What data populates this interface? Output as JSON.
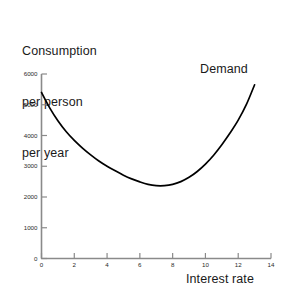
{
  "chart_data": {
    "type": "line",
    "title": "",
    "ylabel_lines": [
      "Consumption",
      "per person",
      "per year"
    ],
    "ylabel": "Consumption per person per year",
    "xlabel": "Interest rate",
    "grid": false,
    "legend_position": "inline-right",
    "annotations": [
      {
        "text": "Demand",
        "x": 11.2,
        "y": 6050
      }
    ],
    "series": [
      {
        "name": "Demand",
        "x": [
          0,
          0.5,
          1,
          1.5,
          2,
          2.5,
          3,
          3.5,
          4,
          4.5,
          5,
          5.5,
          6,
          6.5,
          7,
          7.5,
          8,
          8.5,
          9,
          9.5,
          10,
          10.5,
          11,
          11.5,
          12,
          12.5,
          13
        ],
        "values": [
          5400,
          4900,
          4480,
          4130,
          3840,
          3590,
          3370,
          3170,
          3000,
          2850,
          2710,
          2590,
          2490,
          2410,
          2370,
          2370,
          2410,
          2500,
          2640,
          2830,
          3070,
          3360,
          3700,
          4080,
          4500,
          5010,
          5650
        ]
      }
    ],
    "xlim": [
      0,
      14
    ],
    "ylim": [
      0,
      6000
    ],
    "xticks": [
      "0",
      "2",
      "4",
      "6",
      "8",
      "10",
      "12",
      "14"
    ],
    "ytick_values": [
      "0",
      "1000",
      "2000",
      "3000",
      "4000",
      "5000",
      "6000"
    ],
    "minimum": {
      "x": 6.3,
      "y": 2350
    },
    "line_color": "#000000",
    "axis_color": "#808080",
    "background": "#ffffff"
  }
}
